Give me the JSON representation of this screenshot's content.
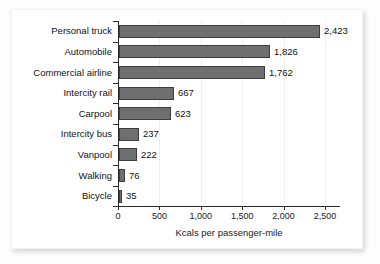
{
  "chart_data": {
    "type": "bar",
    "orientation": "horizontal",
    "title": "",
    "xlabel": "Kcals per passenger-mile",
    "ylabel": "",
    "categories": [
      "Personal truck",
      "Automobile",
      "Commercial airline",
      "Intercity rail",
      "Carpool",
      "Intercity bus",
      "Vanpool",
      "Walking",
      "Bicycle"
    ],
    "values": [
      2423,
      1826,
      1762,
      667,
      623,
      237,
      222,
      76,
      35
    ],
    "value_labels": [
      "2,423",
      "1,826",
      "1,762",
      "667",
      "623",
      "237",
      "222",
      "76",
      "35"
    ],
    "xlim": [
      0,
      2500
    ],
    "xticks": [
      0,
      500,
      1000,
      1500,
      2000,
      2500
    ],
    "xticklabels": [
      "0",
      "500",
      "1,000",
      "1,500",
      "2,000",
      "2,500"
    ],
    "grid": "vertical-faint",
    "legend": "none",
    "bar_color": "#6f6f6f",
    "bar_edge_color": "#3d3d3d",
    "axis_color": "#2a2a2a",
    "background_color": "#ffffff",
    "page_background_color": "#fdfdfd"
  }
}
